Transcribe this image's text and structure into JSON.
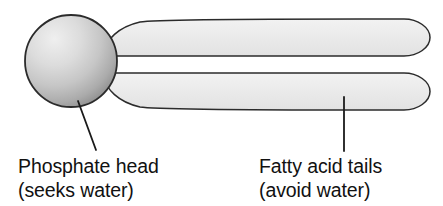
{
  "diagram": {
    "type": "phospholipid-schematic",
    "background_color": "#ffffff",
    "outline_color": "#2b2b2b",
    "head": {
      "name": "phosphate-head",
      "shape": "circle",
      "center_x": 71,
      "center_y": 61,
      "radius": 46.5,
      "fill_light": "#e8e8e8",
      "fill_mid": "#c9c9c9",
      "fill_dark": "#8f8f8f",
      "highlight_x": 48,
      "highlight_y": 36
    },
    "tails": [
      {
        "name": "fatty-acid-tail-upper",
        "left_x": 112,
        "right_x": 430,
        "top_y": 19,
        "bottom_y": 56,
        "fill": "#e9e9e9"
      },
      {
        "name": "fatty-acid-tail-lower",
        "left_x": 112,
        "right_x": 430,
        "top_y": 73,
        "bottom_y": 110,
        "fill": "#e9e9e9"
      }
    ],
    "leaders": [
      {
        "name": "leader-line-phosphate-head",
        "x1": 78,
        "y1": 101,
        "x2": 96,
        "y2": 149,
        "style": "diagonal"
      },
      {
        "name": "leader-line-fatty-acid-tails",
        "x1": 344,
        "y1": 97,
        "x2": 344,
        "y2": 150,
        "style": "vertical"
      }
    ]
  },
  "labels": {
    "phosphate": {
      "name": "phosphate-head-label",
      "line1": "Phosphate head",
      "line2": "(seeks water)",
      "x": 18,
      "y1": 172,
      "y2": 196
    },
    "fatty_acid": {
      "name": "fatty-acid-tails-label",
      "line1": "Fatty acid tails",
      "line2": "(avoid water)",
      "x": 259,
      "y1": 172,
      "y2": 196
    }
  }
}
